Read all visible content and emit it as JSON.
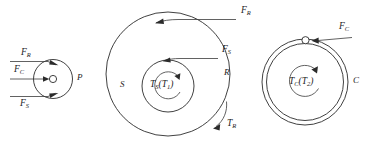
{
  "figure": {
    "width": 370,
    "height": 148,
    "background_color": "#ffffff",
    "line_color": "#2b2b2b"
  },
  "groups": [
    {
      "id": "pulley",
      "name": "Pulley assembly P",
      "body_label": "P",
      "forces": [
        {
          "id": "f-r-left",
          "base": "F",
          "sub": "R",
          "direction": "right",
          "position": "top"
        },
        {
          "id": "f-c-left",
          "base": "F",
          "sub": "C",
          "direction": "right",
          "position": "middle"
        },
        {
          "id": "f-s-left",
          "base": "F",
          "sub": "S",
          "direction": "right",
          "position": "bottom"
        }
      ]
    },
    {
      "id": "ring-sun",
      "name": "Ring and sun assembly",
      "outer_label": "R",
      "inner_label": "S",
      "forces": [
        {
          "id": "f-r-ring",
          "base": "F",
          "sub": "R",
          "direction": "left",
          "position": "outer-top"
        },
        {
          "id": "f-s-sun",
          "base": "F",
          "sub": "S",
          "direction": "left",
          "position": "inner-top"
        }
      ],
      "torques": [
        {
          "id": "t-s",
          "base": "T",
          "sub": "S",
          "alt_base": "T",
          "alt_sub": "1",
          "sense": "counterclockwise",
          "position": "center"
        },
        {
          "id": "t-r",
          "base": "T",
          "sub": "R",
          "sense": "clockwise",
          "position": "outer-bottom-right"
        }
      ]
    },
    {
      "id": "carrier",
      "name": "Carrier assembly C",
      "body_label": "C",
      "forces": [
        {
          "id": "f-c-carrier",
          "base": "F",
          "sub": "C",
          "direction": "left",
          "position": "top"
        }
      ],
      "torques": [
        {
          "id": "t-c",
          "base": "T",
          "sub": "C",
          "alt_base": "T",
          "alt_sub": "2",
          "sense": "counterclockwise",
          "position": "center"
        }
      ]
    }
  ],
  "labels": {
    "f_r_left_base": "F",
    "f_r_left_sub": "R",
    "f_c_left_base": "F",
    "f_c_left_sub": "C",
    "f_s_left_base": "F",
    "f_s_left_sub": "S",
    "pulley_body": "P",
    "f_r_ring_base": "F",
    "f_r_ring_sub": "R",
    "f_s_sun_base": "F",
    "f_s_sun_sub": "S",
    "ring_body": "R",
    "sun_body": "S",
    "t_s_base": "T",
    "t_s_sub": "S",
    "t_s_open": "(",
    "t_s_alt_base": "T",
    "t_s_alt_sub": "1",
    "t_s_close": ")",
    "t_r_base": "T",
    "t_r_sub": "R",
    "f_c_carrier_base": "F",
    "f_c_carrier_sub": "C",
    "carrier_body": "C",
    "t_c_base": "T",
    "t_c_sub": "C",
    "t_c_open": "(",
    "t_c_alt_base": "T",
    "t_c_alt_sub": "2",
    "t_c_close": ")"
  }
}
